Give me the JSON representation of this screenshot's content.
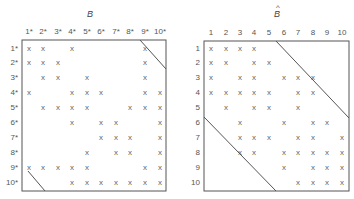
{
  "figure": {
    "matrices": [
      {
        "id": "B",
        "title": "B",
        "hat": false,
        "col_labels": [
          "1*",
          "2*",
          "3*",
          "4*",
          "5*",
          "6*",
          "7*",
          "8*",
          "9*",
          "10*"
        ],
        "row_labels": [
          "1*",
          "2*",
          "3*",
          "4*",
          "5*",
          "6*",
          "7*",
          "8*",
          "9*",
          "10*"
        ],
        "mark": "x",
        "rows": [
          [
            1,
            2,
            4,
            9
          ],
          [
            1,
            2,
            3,
            9
          ],
          [
            2,
            3,
            5,
            9
          ],
          [
            1,
            4,
            5,
            6,
            9,
            10
          ],
          [
            2,
            3,
            4,
            5,
            8,
            9,
            10
          ],
          [
            4,
            6,
            7,
            10
          ],
          [
            6,
            7,
            8,
            10
          ],
          [
            5,
            7,
            8,
            10
          ],
          [
            1,
            2,
            3,
            4,
            5,
            9,
            10
          ],
          [
            4,
            5,
            6,
            7,
            8,
            9,
            10
          ]
        ],
        "box": {
          "x": 22,
          "y": 40,
          "w": 144,
          "h": 151
        },
        "col_x": [
          29,
          43,
          58,
          72,
          87,
          101,
          116,
          130,
          145,
          160
        ],
        "row_y": [
          48,
          62,
          77,
          92,
          107,
          122,
          137,
          152,
          167,
          182
        ],
        "title_pos": {
          "x": 90,
          "y": 17
        },
        "diagonals": [
          {
            "x1": 140,
            "y1": 40,
            "x2": 166,
            "y2": 69
          },
          {
            "x1": 28,
            "y1": 171,
            "x2": 45,
            "y2": 191
          }
        ]
      },
      {
        "id": "B_hat",
        "title": "B",
        "hat": true,
        "col_labels": [
          "1",
          "2",
          "3",
          "4",
          "5",
          "6",
          "7",
          "8",
          "9",
          "10"
        ],
        "row_labels": [
          "1",
          "2",
          "3",
          "4",
          "5",
          "6",
          "7",
          "8",
          "9",
          "10"
        ],
        "mark": "x",
        "rows": [
          [
            1,
            2,
            3,
            4
          ],
          [
            1,
            2,
            4,
            5
          ],
          [
            1,
            3,
            4,
            6,
            7,
            8
          ],
          [
            1,
            2,
            3,
            4,
            5,
            7,
            8
          ],
          [
            2,
            4,
            5,
            7
          ],
          [
            3,
            6,
            8,
            9
          ],
          [
            3,
            4,
            5,
            7,
            8,
            10
          ],
          [
            3,
            4,
            6,
            7,
            8,
            9,
            10
          ],
          [
            6,
            8,
            9,
            10
          ],
          [
            7,
            8,
            9,
            10
          ]
        ],
        "box": {
          "x": 204,
          "y": 41,
          "w": 145,
          "h": 150
        },
        "col_x": [
          211,
          226,
          240,
          254,
          269,
          284,
          298,
          313,
          327,
          342
        ],
        "row_y": [
          48,
          62,
          77,
          92,
          107,
          122,
          137,
          152,
          167,
          182
        ],
        "title_pos": {
          "x": 277,
          "y": 17
        },
        "diagonals": [
          {
            "x1": 276,
            "y1": 41,
            "x2": 349,
            "y2": 118
          },
          {
            "x1": 204,
            "y1": 117,
            "x2": 276,
            "y2": 191
          }
        ]
      }
    ]
  }
}
